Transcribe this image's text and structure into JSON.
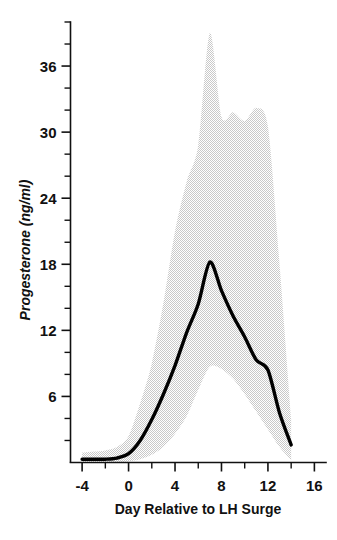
{
  "chart_data": {
    "type": "line",
    "title": "",
    "xlabel": "Day Relative to LH Surge",
    "ylabel": "Progesterone (ng/ml)",
    "xlim": [
      -5,
      17
    ],
    "ylim": [
      0,
      40
    ],
    "xticks": [
      -4,
      0,
      4,
      8,
      12,
      16
    ],
    "xtick_labels": [
      "-4",
      "0",
      "4",
      "8",
      "12",
      "16"
    ],
    "xminor_step": 2,
    "yticks": [
      6,
      12,
      18,
      24,
      30,
      36
    ],
    "ytick_labels": [
      "6",
      "12",
      "18",
      "24",
      "30",
      "36"
    ],
    "yminor_step": 2,
    "grid": false,
    "legend": false,
    "x": [
      -4,
      -3,
      -2,
      -1,
      0,
      1,
      2,
      3,
      4,
      5,
      6,
      7,
      8,
      9,
      10,
      11,
      12,
      13,
      14
    ],
    "series": [
      {
        "name": "Mean progesterone",
        "style": "solid-black-thick",
        "color": "#000000",
        "values": [
          0.3,
          0.3,
          0.3,
          0.4,
          0.8,
          2.0,
          3.9,
          6.2,
          8.8,
          11.8,
          14.4,
          18.2,
          15.6,
          13.3,
          11.4,
          9.3,
          8.4,
          4.5,
          1.6
        ]
      },
      {
        "name": "Range upper bound",
        "style": "stipple-band-upper",
        "color": "#e6e6e6",
        "values": [
          0.9,
          1.0,
          1.1,
          1.4,
          2.4,
          5.4,
          9.0,
          14.5,
          21.0,
          25.5,
          28.8,
          39.0,
          31.4,
          31.8,
          31.0,
          32.2,
          30.5,
          18.0,
          4.0
        ]
      },
      {
        "name": "Range lower bound",
        "style": "stipple-band-lower",
        "color": "#e6e6e6",
        "values": [
          0.0,
          0.0,
          0.0,
          0.0,
          0.1,
          0.3,
          0.7,
          1.4,
          2.6,
          4.2,
          6.6,
          8.7,
          8.5,
          7.6,
          6.2,
          4.6,
          3.0,
          1.4,
          0.2
        ]
      }
    ],
    "band": {
      "fill": "#e6e6e6",
      "texture": "stipple",
      "description": "shaded range envelope around mean progesterone curve"
    }
  },
  "axes": {
    "y_axis_name": "progesterone-axis",
    "x_axis_name": "day-axis"
  }
}
